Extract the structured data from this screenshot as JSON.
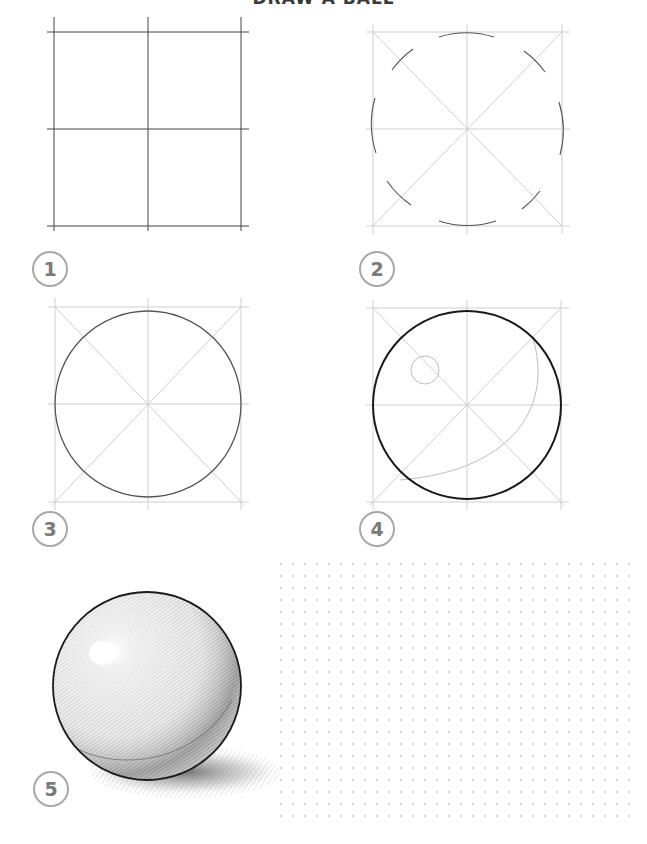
{
  "title": "DRAW A BALL",
  "steps": [
    {
      "number": "1",
      "description": "Draw a square divided into four equal quarters"
    },
    {
      "number": "2",
      "description": "Add diagonals and mark arc guide points of the circle"
    },
    {
      "number": "3",
      "description": "Connect the arcs into a full circle"
    },
    {
      "number": "4",
      "description": "Outline the ball, mark the highlight and the shadow line"
    },
    {
      "number": "5",
      "description": "Shade the ball with hatching and add a cast shadow"
    }
  ],
  "practice_area": {
    "type": "dot-grid",
    "spacing_px": 12
  },
  "colors": {
    "construction_line": "#c8c8c8",
    "dark_line": "#444444",
    "outline": "#1a1a1a",
    "badge_border": "#a8a8a8",
    "badge_text": "#7a7a7a",
    "dot": "#d4d4d4"
  }
}
